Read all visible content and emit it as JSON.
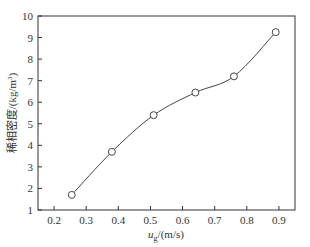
{
  "chart_data": {
    "type": "line",
    "title": "",
    "xlabel": "u_g/(m/s)",
    "ylabel": "稀相密度/(kg/m³)",
    "xlim": [
      0.15,
      0.95
    ],
    "ylim": [
      1,
      10
    ],
    "x_ticks": [
      0.2,
      0.3,
      0.4,
      0.5,
      0.6,
      0.7,
      0.8,
      0.9
    ],
    "y_ticks": [
      1,
      2,
      3,
      4,
      5,
      6,
      7,
      8,
      9,
      10
    ],
    "grid": false,
    "legend": null,
    "series": [
      {
        "name": "dilute phase density",
        "marker": "open-circle",
        "line": "smooth fitted curve",
        "x": [
          0.255,
          0.38,
          0.51,
          0.64,
          0.76,
          0.89
        ],
        "y": [
          1.7,
          3.7,
          5.4,
          6.45,
          7.2,
          9.25
        ]
      }
    ]
  },
  "axes": {
    "x_title_main": "u",
    "x_title_sub": "g",
    "x_title_unit": "/(m/s)",
    "y_title_main": "稀相密度/(kg/m",
    "y_title_sup": "3",
    "y_title_end": ")"
  },
  "style": {
    "axis_color": "#333333",
    "line_color": "#444444",
    "marker_fill": "#ffffff"
  }
}
